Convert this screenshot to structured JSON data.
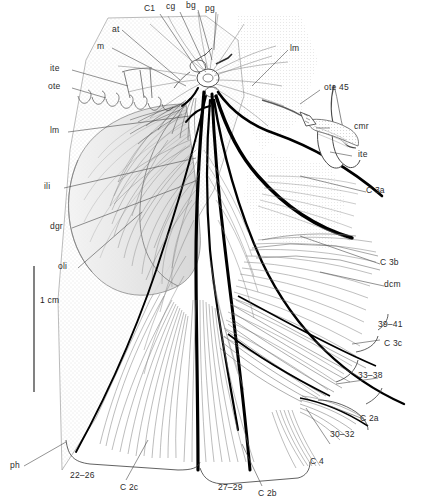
{
  "figure": {
    "type": "anatomical-line-drawing",
    "scale_bar": {
      "label": "1 cm",
      "orientation": "vertical"
    },
    "background_color": "#ffffff",
    "ink_color": "#000000",
    "shading_color": "#b9b9b9"
  },
  "labels": {
    "top": [
      {
        "id": "at",
        "text": "at"
      },
      {
        "id": "m",
        "text": "m"
      },
      {
        "id": "C1",
        "text": "C1"
      },
      {
        "id": "cg",
        "text": "cg"
      },
      {
        "id": "bg",
        "text": "bg"
      },
      {
        "id": "pg",
        "text": "pg"
      },
      {
        "id": "lm_right",
        "text": "lm"
      }
    ],
    "left": [
      {
        "id": "ite_left",
        "text": "ite"
      },
      {
        "id": "ote_left",
        "text": "ote"
      },
      {
        "id": "lm_left",
        "text": "lm"
      },
      {
        "id": "ili",
        "text": "ili"
      },
      {
        "id": "dgr",
        "text": "dgr"
      },
      {
        "id": "oli",
        "text": "oli"
      },
      {
        "id": "ph",
        "text": "ph"
      }
    ],
    "right": [
      {
        "id": "ote45",
        "text": "ote 45"
      },
      {
        "id": "cmr",
        "text": "cmr"
      },
      {
        "id": "ite_right",
        "text": "ite"
      },
      {
        "id": "C3a",
        "text": "C 3a"
      },
      {
        "id": "C3b",
        "text": "C 3b"
      },
      {
        "id": "dcm",
        "text": "dcm"
      },
      {
        "id": "n39_41",
        "text": "39–41"
      },
      {
        "id": "C3c",
        "text": "C 3c"
      },
      {
        "id": "n33_38",
        "text": "33–38"
      },
      {
        "id": "C2a",
        "text": "C 2a"
      },
      {
        "id": "n30_32",
        "text": "30–32"
      },
      {
        "id": "C4",
        "text": "C 4"
      }
    ],
    "bottom": [
      {
        "id": "n22_26",
        "text": "22–26"
      },
      {
        "id": "C2c",
        "text": "C 2c"
      },
      {
        "id": "n27_29",
        "text": "27–29"
      },
      {
        "id": "C2b",
        "text": "C 2b"
      }
    ],
    "scale": {
      "id": "scale_1cm",
      "text": "1 cm"
    }
  }
}
